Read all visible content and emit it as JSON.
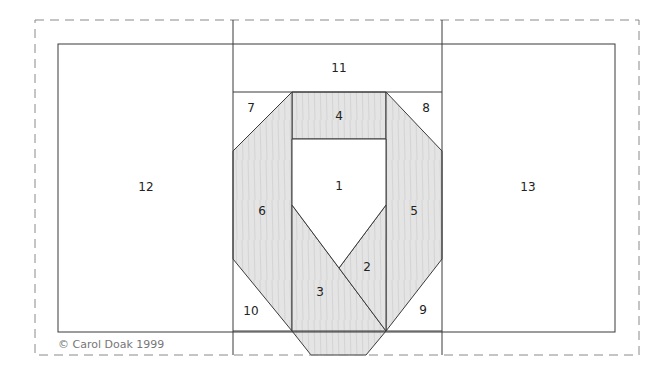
{
  "diagram": {
    "type": "foundation paper-piecing pattern",
    "copyright": "© Carol Doak 1999",
    "colors": {
      "fabric_fill": "#e3e3e3",
      "line": "#3a3a3a",
      "dashed": "#8a8a8a",
      "background": "#ffffff"
    },
    "pieces": [
      {
        "id": "1",
        "label": "1",
        "fill": "white",
        "x": 339,
        "y": 186
      },
      {
        "id": "2",
        "label": "2",
        "fill": "shaded",
        "x": 367,
        "y": 267
      },
      {
        "id": "3",
        "label": "3",
        "fill": "shaded",
        "x": 320,
        "y": 292
      },
      {
        "id": "4",
        "label": "4",
        "fill": "shaded",
        "x": 339,
        "y": 116
      },
      {
        "id": "5",
        "label": "5",
        "fill": "shaded",
        "x": 414,
        "y": 211
      },
      {
        "id": "6",
        "label": "6",
        "fill": "shaded",
        "x": 262,
        "y": 211
      },
      {
        "id": "7",
        "label": "7",
        "fill": "white",
        "x": 251,
        "y": 108
      },
      {
        "id": "8",
        "label": "8",
        "fill": "white",
        "x": 426,
        "y": 108
      },
      {
        "id": "9",
        "label": "9",
        "fill": "white",
        "x": 423,
        "y": 310
      },
      {
        "id": "10",
        "label": "10",
        "fill": "white",
        "x": 251,
        "y": 311
      },
      {
        "id": "11",
        "label": "11",
        "fill": "white",
        "x": 339,
        "y": 68
      },
      {
        "id": "12",
        "label": "12",
        "fill": "white",
        "x": 146,
        "y": 187
      },
      {
        "id": "13",
        "label": "13",
        "fill": "white",
        "x": 528,
        "y": 187
      }
    ]
  }
}
